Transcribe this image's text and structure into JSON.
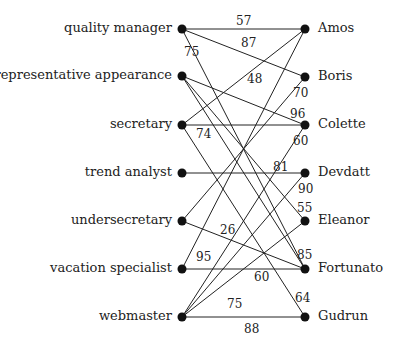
{
  "diagram": {
    "type": "bipartite-graph",
    "left_nodes": [
      {
        "id": "L0",
        "label": "quality manager",
        "y": 29
      },
      {
        "id": "L1",
        "label": "representative appearance",
        "y": 76
      },
      {
        "id": "L2",
        "label": "secretary",
        "y": 125
      },
      {
        "id": "L3",
        "label": "trend analyst",
        "y": 173
      },
      {
        "id": "L4",
        "label": "undersecretary",
        "y": 221
      },
      {
        "id": "L5",
        "label": "vacation specialist",
        "y": 269
      },
      {
        "id": "L6",
        "label": "webmaster",
        "y": 317
      }
    ],
    "right_nodes": [
      {
        "id": "R0",
        "label": "Amos",
        "y": 29
      },
      {
        "id": "R1",
        "label": "Boris",
        "y": 77
      },
      {
        "id": "R2",
        "label": "Colette",
        "y": 125
      },
      {
        "id": "R3",
        "label": "Devdatt",
        "y": 173
      },
      {
        "id": "R4",
        "label": "Eleanor",
        "y": 221
      },
      {
        "id": "R5",
        "label": "Fortunato",
        "y": 269
      },
      {
        "id": "R6",
        "label": "Gudrun",
        "y": 317
      }
    ],
    "edges": [
      {
        "from": "L0",
        "to": "R0",
        "weight": "57",
        "lx": 236,
        "ly": 14
      },
      {
        "from": "L0",
        "to": "R1",
        "weight": "87",
        "lx": 241,
        "ly": 36
      },
      {
        "from": "L0",
        "to": "R5",
        "weight": "75",
        "lx": 184,
        "ly": 45
      },
      {
        "from": "L2",
        "to": "R0",
        "weight": "48",
        "lx": 247,
        "ly": 72
      },
      {
        "from": "L5",
        "to": "R0",
        "weight": "95",
        "lx": 196,
        "ly": 250
      },
      {
        "from": "L4",
        "to": "R1",
        "weight": "70",
        "lx": 293,
        "ly": 86
      },
      {
        "from": "L1",
        "to": "R2",
        "weight": "96",
        "lx": 290,
        "ly": 107
      },
      {
        "from": "L2",
        "to": "R2",
        "weight": "74",
        "lx": 196,
        "ly": 127
      },
      {
        "from": "L6",
        "to": "R2",
        "weight": "60",
        "lx": 293,
        "ly": 134
      },
      {
        "from": "L3",
        "to": "R3",
        "weight": "81",
        "lx": 273,
        "ly": 160
      },
      {
        "from": "L6",
        "to": "R3",
        "weight": "90",
        "lx": 298,
        "ly": 182
      },
      {
        "from": "L1",
        "to": "R4",
        "weight": "55",
        "lx": 297,
        "ly": 201
      },
      {
        "from": "L6",
        "to": "R4",
        "weight": "75",
        "lx": 227,
        "ly": 297
      },
      {
        "from": "L1",
        "to": "R5",
        "weight": "85",
        "lx": 297,
        "ly": 248
      },
      {
        "from": "L4",
        "to": "R5",
        "weight": "26",
        "lx": 220,
        "ly": 223
      },
      {
        "from": "L5",
        "to": "R5",
        "weight": "60",
        "lx": 254,
        "ly": 270
      },
      {
        "from": "L2",
        "to": "R6",
        "weight": "64",
        "lx": 295,
        "ly": 291
      },
      {
        "from": "L6",
        "to": "R6",
        "weight": "88",
        "lx": 244,
        "ly": 322
      }
    ]
  }
}
